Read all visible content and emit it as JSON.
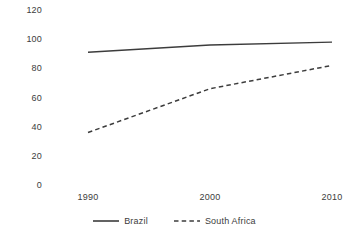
{
  "chart_data": {
    "type": "line",
    "title": "",
    "subtitle": "",
    "xlabel": "",
    "ylabel": "",
    "x": [
      1990,
      2000,
      2010
    ],
    "categories": [
      "1990",
      "2000",
      "2010"
    ],
    "xtick_labels": [
      "1990",
      "2000",
      "2010"
    ],
    "ytick_labels": [
      "120",
      "100",
      "80",
      "60",
      "40",
      "20",
      "0"
    ],
    "yticks": [
      120,
      100,
      80,
      60,
      40,
      20,
      0
    ],
    "ylim": [
      0,
      120
    ],
    "xlim": [
      1990,
      2010
    ],
    "grid": false,
    "legend_position": "bottom-center",
    "series": [
      {
        "name": "Brazil",
        "values": [
          91,
          96,
          98
        ],
        "style": "solid",
        "color": "#3c3c3c"
      },
      {
        "name": "South Africa",
        "values": [
          36,
          66,
          82
        ],
        "style": "dashed",
        "color": "#3c3c3c"
      }
    ]
  },
  "legend": {
    "items": [
      {
        "label": "Brazil",
        "style": "solid"
      },
      {
        "label": "South Africa",
        "style": "dashed"
      }
    ]
  },
  "colors": {
    "background": "#ffffff",
    "text": "#3c3c3c",
    "line": "#3c3c3c"
  }
}
